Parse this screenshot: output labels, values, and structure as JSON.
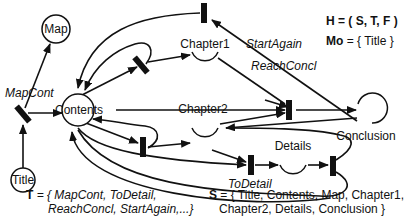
{
  "diagram": {
    "type": "petri-net",
    "places": [
      {
        "id": "title",
        "label": "Title"
      },
      {
        "id": "map",
        "label": "Map"
      },
      {
        "id": "contents",
        "label": "Contents"
      },
      {
        "id": "chapter1",
        "label": "Chapter1"
      },
      {
        "id": "chapter2",
        "label": "Chapter2"
      },
      {
        "id": "details",
        "label": "Details"
      },
      {
        "id": "conclusion",
        "label": "Conclusion"
      }
    ],
    "transitions": [
      {
        "id": "mapcont",
        "label": "MapCont"
      },
      {
        "id": "startagain",
        "label": "StartAgain"
      },
      {
        "id": "reachconcl",
        "label": "ReachConcl"
      },
      {
        "id": "todetail",
        "label": "ToDetail"
      }
    ],
    "definitions": {
      "h": {
        "lhs": "H",
        "rhs": "= ( S, T, F )"
      },
      "mo": {
        "lhs": "Mo",
        "rhs": "= { Title }"
      },
      "t": {
        "lhs": "T",
        "line1": "= { MapCont, ToDetail,",
        "line2": "ReachConcl, StartAgain,...}"
      },
      "s": {
        "lhs": "S",
        "line1": "= { Title, Contents, Map, Chapter1,",
        "line2": "Chapter2, Details, Conclusion }"
      }
    }
  }
}
